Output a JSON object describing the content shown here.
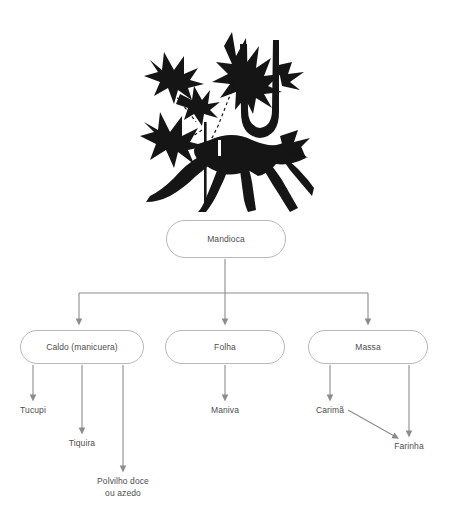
{
  "diagram": {
    "type": "flowchart",
    "title_text": "",
    "colors": {
      "background": "#ffffff",
      "box_border": "#b8b8b8",
      "text": "#4e4e4e",
      "connector": "#8c8c8c",
      "illustration": "#151515"
    },
    "illustration": {
      "name": "cassava-plant-silhouette",
      "description": "Black silhouette of a mandioca (cassava) plant with palmate leaves, stems and tuberous roots"
    },
    "root": {
      "id": "mandioca",
      "label": "Mandioca",
      "x": 166,
      "y": 220,
      "w": 120,
      "h": 38
    },
    "branches": [
      {
        "id": "caldo",
        "label": "Caldo (manicuera)",
        "x": 20,
        "y": 330,
        "w": 124,
        "h": 34,
        "children": [
          {
            "id": "tucupi",
            "label": "Tucupi",
            "cx": 33,
            "y": 411,
            "stem_end": 400
          },
          {
            "id": "tiquira",
            "label": "Tiquira",
            "cx": 82,
            "y": 444,
            "stem_end": 433
          },
          {
            "id": "polvilho",
            "label": "Polvilho doce\nou azedo",
            "cx": 123,
            "y": 482,
            "stem_end": 471
          }
        ]
      },
      {
        "id": "folha",
        "label": "Folha",
        "x": 165,
        "y": 330,
        "w": 120,
        "h": 34,
        "children": [
          {
            "id": "maniva",
            "label": "Maniva",
            "cx": 225,
            "y": 411,
            "stem_end": 400
          }
        ]
      },
      {
        "id": "massa",
        "label": "Massa",
        "x": 308,
        "y": 330,
        "w": 120,
        "h": 34,
        "children": [
          {
            "id": "carima",
            "label": "Carimã",
            "cx": 330,
            "y": 411,
            "stem_end": 400
          },
          {
            "id": "farinha",
            "label": "Farinha",
            "cx": 409,
            "y": 447,
            "stem_end": 436
          }
        ]
      }
    ],
    "cross_edge": {
      "from": "carima",
      "to": "farinha",
      "label": ""
    }
  }
}
